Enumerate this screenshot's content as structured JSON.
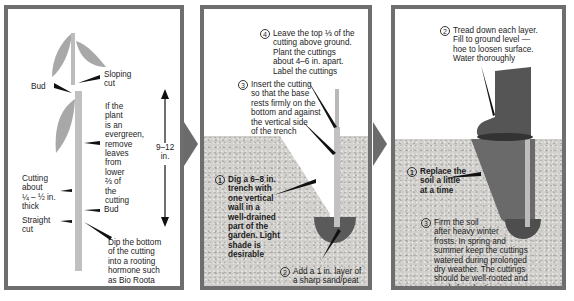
{
  "panel1": {
    "labels": {
      "bud_top": "Bud",
      "sloping_cut": "Sloping\ncut",
      "evergreen_note": "If the\nplant\nis an\nevergreen,\nremove\nleaves\nfrom\nlower\n⅔ of\nthe\ncutting",
      "length": "9–12\nin.",
      "thickness": "Cutting\nabout\n¼ – ½ in.\nthick",
      "bud_bottom": "Bud",
      "straight_cut": "Straight\ncut",
      "dip_note": "Dip the bottom\nof the cutting\ninto a rooting\nhormone such\nas Bio Roota"
    }
  },
  "panel2": {
    "steps": [
      {
        "number": "1",
        "text": "Dig a 6–8 in.\ntrench with\none vertical\nwall in a\nwell-drained\npart of the\ngarden. Light\nshade is\ndesirable"
      },
      {
        "number": "2",
        "text": "Add a 1 in. layer of\na sharp sand/peat\nmixture"
      },
      {
        "number": "3",
        "text": "Insert the cutting\nso that the base\nrests firmly on the\nbottom and against\nthe vertical side\nof the trench"
      },
      {
        "number": "4",
        "text": "Leave the top ⅓ of the\ncutting above ground.\nPlant the cuttings\nabout 4–6 in. apart.\nLabel the cuttings"
      }
    ]
  },
  "panel3": {
    "steps": [
      {
        "number": "1",
        "text": "Replace the\nsoil a little\nat a time"
      },
      {
        "number": "2",
        "text": "Tread down each layer.\nFill to ground level —\nhoe to loosen surface.\nWater thoroughly"
      },
      {
        "number": "3",
        "text": "Firm the soil\nafter heavy winter\nfrosts. In spring and\nsummer keep the cuttings\nwatered during prolonged\ndry weather. The cuttings\nshould be well-rooted and\nready for planting in\nabout 12 months' time"
      }
    ]
  },
  "colors": {
    "border": "#6e6e6e",
    "soil": "#d2d0cc",
    "trench": "#5a5a5a",
    "stem": "#b9b9b9",
    "leaf": "#a9a9a9",
    "boot": "#555555"
  }
}
